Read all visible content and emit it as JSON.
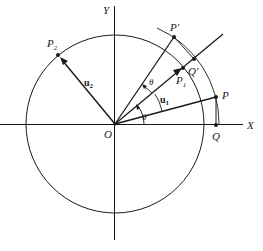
{
  "figure": {
    "axes": {
      "x_label": "X",
      "y_label": "Y",
      "origin_label": "O"
    },
    "points": {
      "P": "P",
      "Q": "Q",
      "P_prime": "P′",
      "Q_prime": "Q′",
      "P1": "P",
      "P1_sub": "1",
      "P2": "P",
      "P2_sub": "2"
    },
    "vectors": {
      "u1": "u",
      "u1_sub": "1",
      "u2": "u",
      "u2_sub": "2"
    },
    "angles": {
      "theta_lower": "θ",
      "theta_upper": "θ"
    },
    "colors": {
      "stroke": "#1a1a1a",
      "background": "#ffffff"
    }
  }
}
